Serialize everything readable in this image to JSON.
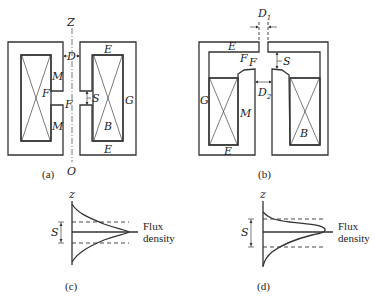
{
  "figure": {
    "panel_a": {
      "caption": "(a)",
      "axis_top_label": "Z",
      "axis_bottom_label": "O",
      "labels": {
        "D": "D",
        "M_top": "M",
        "M_bottom": "M",
        "F_left": "F",
        "F_gap": "F",
        "S": "S",
        "E_top": "E",
        "E_bottom": "E",
        "G": "G",
        "B": "B"
      }
    },
    "panel_b": {
      "caption": "(b)",
      "labels": {
        "D1": "D",
        "D1_sub": "1",
        "D2": "D",
        "D2_sub": "2",
        "E_top": "E",
        "E_bottom": "E",
        "F1": "F",
        "F2": "F",
        "S": "S",
        "G": "G",
        "M": "M",
        "B": "B"
      }
    },
    "panel_c": {
      "caption": "(c)",
      "axis_label": "z",
      "S_label": "S",
      "legend_line1": "Flux",
      "legend_line2": "density"
    },
    "panel_d": {
      "caption": "(d)",
      "axis_label": "z",
      "S_label": "S",
      "legend_line1": "Flux",
      "legend_line2": "density"
    }
  }
}
